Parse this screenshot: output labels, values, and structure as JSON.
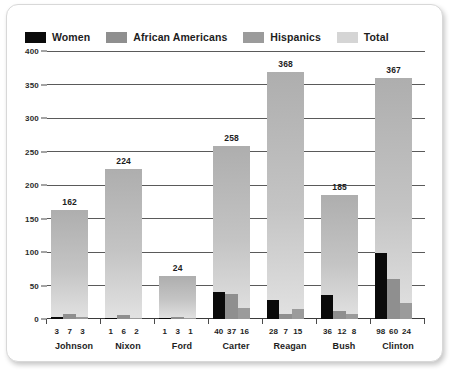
{
  "legend": {
    "items": [
      {
        "label": "Women",
        "color": "#0a0a0a"
      },
      {
        "label": "African Americans",
        "color": "#8f8f8f"
      },
      {
        "label": "Hispanics",
        "color": "#9b9b9b"
      },
      {
        "label": "Total",
        "color": "#d5d5d5"
      }
    ]
  },
  "axis": {
    "y_ticks": [
      "400",
      "350",
      "300",
      "250",
      "200",
      "150",
      "100",
      "50",
      "0"
    ]
  },
  "chart_data": {
    "type": "bar",
    "title": "",
    "subtitle": "",
    "xlabel": "",
    "ylabel": "",
    "ylim": [
      0,
      400
    ],
    "y_ticks": [
      0,
      50,
      100,
      150,
      200,
      250,
      300,
      350,
      400
    ],
    "grid": true,
    "legend_position": "top-left",
    "categories": [
      "Johnson",
      "Nixon",
      "Ford",
      "Carter",
      "Reagan",
      "Bush",
      "Clinton"
    ],
    "series": [
      {
        "name": "Women",
        "values": [
          3,
          1,
          1,
          40,
          28,
          36,
          98
        ]
      },
      {
        "name": "African Americans",
        "values": [
          7,
          6,
          3,
          37,
          7,
          12,
          60
        ]
      },
      {
        "name": "Hispanics",
        "values": [
          3,
          2,
          1,
          16,
          15,
          8,
          24
        ]
      },
      {
        "name": "Total",
        "values": [
          162,
          224,
          24,
          258,
          368,
          185,
          367
        ]
      }
    ],
    "total_bar_heights": [
      162,
      224,
      64,
      258,
      368,
      185,
      360
    ],
    "total_labels": [
      "162",
      "224",
      "24",
      "258",
      "368",
      "185",
      "367"
    ]
  },
  "groups": [
    {
      "name": "Johnson",
      "total_label": "162",
      "total_height": 162,
      "sub": [
        {
          "label": "3",
          "value": 3
        },
        {
          "label": "7",
          "value": 7
        },
        {
          "label": "3",
          "value": 3
        }
      ]
    },
    {
      "name": "Nixon",
      "total_label": "224",
      "total_height": 224,
      "sub": [
        {
          "label": "1",
          "value": 1
        },
        {
          "label": "6",
          "value": 6
        },
        {
          "label": "2",
          "value": 2
        }
      ]
    },
    {
      "name": "Ford",
      "total_label": "24",
      "total_height": 64,
      "sub": [
        {
          "label": "1",
          "value": 1
        },
        {
          "label": "3",
          "value": 3
        },
        {
          "label": "1",
          "value": 1
        }
      ]
    },
    {
      "name": "Carter",
      "total_label": "258",
      "total_height": 258,
      "sub": [
        {
          "label": "40",
          "value": 40
        },
        {
          "label": "37",
          "value": 37
        },
        {
          "label": "16",
          "value": 16
        }
      ]
    },
    {
      "name": "Reagan",
      "total_label": "368",
      "total_height": 368,
      "sub": [
        {
          "label": "28",
          "value": 28
        },
        {
          "label": "7",
          "value": 7
        },
        {
          "label": "15",
          "value": 15
        }
      ]
    },
    {
      "name": "Bush",
      "total_label": "185",
      "total_height": 185,
      "sub": [
        {
          "label": "36",
          "value": 36
        },
        {
          "label": "12",
          "value": 12
        },
        {
          "label": "8",
          "value": 8
        }
      ]
    },
    {
      "name": "Clinton",
      "total_label": "367",
      "total_height": 360,
      "sub": [
        {
          "label": "98",
          "value": 98
        },
        {
          "label": "60",
          "value": 60
        },
        {
          "label": "24",
          "value": 24
        }
      ]
    }
  ]
}
